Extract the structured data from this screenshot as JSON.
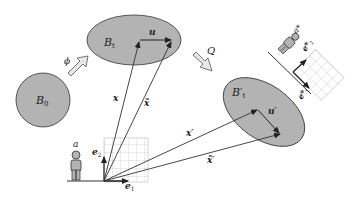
{
  "diagram": {
    "colors": {
      "body_fill": "#b3b3b3",
      "stroke": "#333333",
      "grid": "#bdbdbd",
      "arrow_fill": "#e6e6e6"
    },
    "bodies": [
      {
        "id": "B0",
        "label": "B",
        "sub": "0"
      },
      {
        "id": "Bt",
        "label": "B",
        "sub": "t"
      },
      {
        "id": "Btp",
        "label": "B′",
        "sub": "t"
      }
    ],
    "maps": [
      {
        "id": "phi",
        "label": "ϕ"
      },
      {
        "id": "Q",
        "label": "Q"
      }
    ],
    "vectors": {
      "u": "u",
      "u_prime": "u′",
      "x": "x",
      "x_tilde": "x̃",
      "x_prime": "x′",
      "x_tilde_prime": "x̃′"
    },
    "observers": [
      {
        "id": "a",
        "label": "a",
        "basis": [
          "e",
          "e"
        ],
        "basis_sub": [
          "1",
          "2"
        ]
      },
      {
        "id": "a_star",
        "label": "a*",
        "basis": [
          "e*",
          "e*"
        ],
        "basis_sub": [
          "1",
          "2"
        ]
      }
    ]
  }
}
